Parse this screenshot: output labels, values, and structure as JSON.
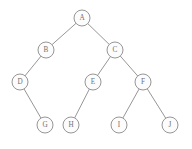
{
  "figure": {
    "type": "tree-graph",
    "width": 192,
    "height": 149,
    "background_color": "#ffffff",
    "stroke_color": "#8a8a8a",
    "node_fill_color": "#fcfcfc",
    "label_color": "#6f6f6f",
    "node_radius": 8
  },
  "nodes": [
    {
      "id": "A",
      "label": "A",
      "cx": 82,
      "cy": 18,
      "r": 8
    },
    {
      "id": "B",
      "label": "B",
      "cx": 46,
      "cy": 50,
      "r": 8
    },
    {
      "id": "C",
      "label": "C",
      "cx": 115,
      "cy": 50,
      "r": 8
    },
    {
      "id": "D",
      "label": "D",
      "cx": 20,
      "cy": 82,
      "r": 8
    },
    {
      "id": "E",
      "label": "E",
      "cx": 93,
      "cy": 82,
      "r": 8
    },
    {
      "id": "F",
      "label": "F",
      "cx": 143,
      "cy": 82,
      "r": 8
    },
    {
      "id": "G",
      "label": "G",
      "cx": 45,
      "cy": 125,
      "r": 8
    },
    {
      "id": "H",
      "label": "H",
      "cx": 71,
      "cy": 125,
      "r": 8
    },
    {
      "id": "I",
      "label": "I",
      "cx": 119,
      "cy": 125,
      "r": 8
    },
    {
      "id": "J",
      "label": "J",
      "cx": 170,
      "cy": 125,
      "r": 8
    }
  ],
  "edges": [
    {
      "from": "A",
      "to": "B"
    },
    {
      "from": "A",
      "to": "C"
    },
    {
      "from": "B",
      "to": "D"
    },
    {
      "from": "C",
      "to": "E"
    },
    {
      "from": "C",
      "to": "F"
    },
    {
      "from": "D",
      "to": "G"
    },
    {
      "from": "E",
      "to": "H"
    },
    {
      "from": "F",
      "to": "I"
    },
    {
      "from": "F",
      "to": "J"
    }
  ]
}
